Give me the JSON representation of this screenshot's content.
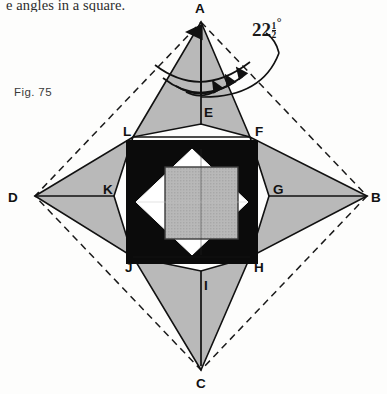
{
  "page": {
    "caption_top": "e angles in a square.",
    "figure_label": "Fig. 75",
    "background_color": "#fdfdfc"
  },
  "annotation": {
    "angle_whole": "22",
    "fraction_numerator": "1",
    "fraction_denominator": "2",
    "degree_symbol": "°",
    "full_text": "22½°"
  },
  "figure": {
    "type": "geometric-diagram",
    "colors": {
      "shade_gray": "#b4b4b4",
      "black_fill": "#0a0a0a",
      "white_fill": "#ffffff",
      "stroke": "#111111",
      "dash_stroke": "#1a1a1a"
    },
    "outer_vertices": [
      {
        "label": "A",
        "x": 201,
        "y": 22,
        "text_x": 195,
        "text_y": 13
      },
      {
        "label": "B",
        "x": 367,
        "y": 196,
        "text_x": 372,
        "text_y": 202
      },
      {
        "label": "C",
        "x": 201,
        "y": 370,
        "text_x": 196,
        "text_y": 386
      },
      {
        "label": "D",
        "x": 35,
        "y": 196,
        "text_x": 10,
        "text_y": 202
      }
    ],
    "inner_vertices": [
      {
        "label": "E",
        "x": 201,
        "y": 124,
        "text_x": 205,
        "text_y": 114
      },
      {
        "label": "F",
        "x": 250,
        "y": 137,
        "text_x": 254,
        "text_y": 133
      },
      {
        "label": "G",
        "x": 269,
        "y": 196,
        "text_x": 272,
        "text_y": 192
      },
      {
        "label": "H",
        "x": 250,
        "y": 257,
        "text_x": 254,
        "text_y": 270
      },
      {
        "label": "I",
        "x": 201,
        "y": 271,
        "text_x": 205,
        "text_y": 288
      },
      {
        "label": "J",
        "x": 133,
        "y": 257,
        "text_x": 126,
        "text_y": 270
      },
      {
        "label": "K",
        "x": 114,
        "y": 196,
        "text_x": 104,
        "text_y": 192
      },
      {
        "label": "L",
        "x": 133,
        "y": 137,
        "text_x": 125,
        "text_y": 133
      }
    ],
    "black_square": {
      "x": 126,
      "y": 140,
      "width": 132,
      "height": 124
    },
    "white_diamond": {
      "cx": 192,
      "cy": 202,
      "rx": 56,
      "ry": 53
    },
    "inner_gray_square": {
      "x": 165,
      "y": 167,
      "width": 73,
      "height": 72
    },
    "arc_count": 4,
    "dashed_diamond": true
  }
}
